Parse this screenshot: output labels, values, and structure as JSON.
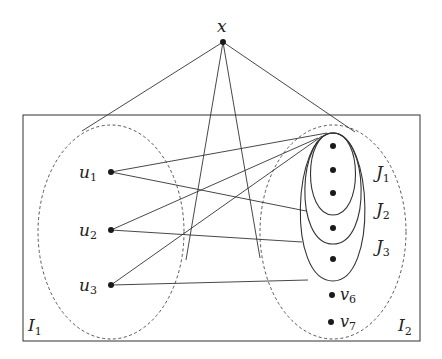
{
  "diagram": {
    "type": "graph",
    "colors": {
      "stroke": "#333333",
      "node": "#1a1a1a",
      "background": "#ffffff"
    },
    "top_vertex": {
      "label": "x",
      "pos": [
        223,
        42
      ]
    },
    "box": {
      "x": 23,
      "y": 115,
      "w": 397,
      "h": 226
    },
    "sets": {
      "I1": {
        "label": "I",
        "sub": "1",
        "style": "dashed",
        "label_pos": [
          28,
          331
        ]
      },
      "I2": {
        "label": "I",
        "sub": "2",
        "style": "dashed",
        "label_pos": [
          398,
          331
        ]
      },
      "J1": {
        "label": "J",
        "sub": "1",
        "label_pos": [
          376,
          178
        ]
      },
      "J2": {
        "label": "J",
        "sub": "2",
        "label_pos": [
          376,
          215
        ]
      },
      "J3": {
        "label": "J",
        "sub": "3",
        "label_pos": [
          376,
          252
        ]
      }
    },
    "left_vertices": [
      {
        "label": "u",
        "sub": "1",
        "pos": [
          111,
          172
        ]
      },
      {
        "label": "u",
        "sub": "2",
        "pos": [
          111,
          230
        ]
      },
      {
        "label": "u",
        "sub": "3",
        "pos": [
          111,
          285
        ]
      }
    ],
    "right_vertices": [
      {
        "label": "",
        "pos": [
          333,
          146
        ]
      },
      {
        "label": "",
        "pos": [
          333,
          170
        ]
      },
      {
        "label": "",
        "pos": [
          333,
          193
        ]
      },
      {
        "label": "",
        "pos": [
          333,
          228
        ]
      },
      {
        "label": "",
        "pos": [
          333,
          259
        ]
      },
      {
        "label": "v",
        "sub": "6",
        "pos": [
          332,
          295
        ]
      },
      {
        "label": "v",
        "sub": "7",
        "pos": [
          331,
          322
        ]
      }
    ]
  }
}
